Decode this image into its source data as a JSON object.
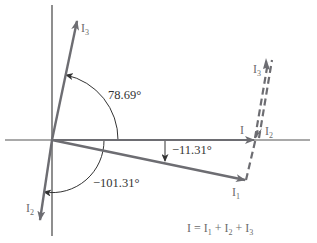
{
  "diagram": {
    "colors": {
      "axis": "#444444",
      "phasor": "#6d6d72",
      "arc": "#333333",
      "text": "#333333",
      "label": "#6b6b6b"
    },
    "phasors": [
      {
        "name": "I",
        "sub": "",
        "angle_deg": 0
      },
      {
        "name": "I",
        "sub": "1",
        "angle_deg": -11.31
      },
      {
        "name": "I",
        "sub": "2",
        "angle_deg": -101.31
      },
      {
        "name": "I",
        "sub": "3",
        "angle_deg": 78.69
      }
    ],
    "angle_labels": {
      "i3_angle": "78.69°",
      "i1_angle": "−11.31°",
      "i2_angle": "−101.31°"
    },
    "labels": {
      "i_main": "I",
      "i1": "I",
      "i1_sub": "1",
      "i2_left": "I",
      "i2_left_sub": "2",
      "i2_right": "I",
      "i2_right_sub": "2",
      "i3_left": "I",
      "i3_left_sub": "3",
      "i3_right": "I",
      "i3_right_sub": "3"
    },
    "equation": {
      "lhs": "I",
      "eq": " = ",
      "t1": "I",
      "t1_sub": "1",
      "plus1": " + ",
      "t2": "I",
      "t2_sub": "2",
      "plus2": " + ",
      "t3": "I",
      "t3_sub": "3"
    }
  }
}
